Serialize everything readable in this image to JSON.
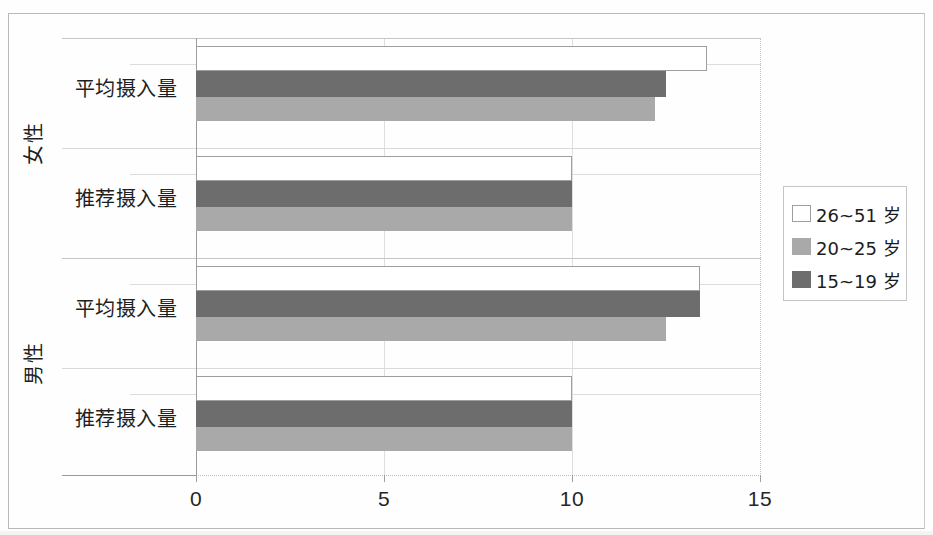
{
  "chart_data": {
    "type": "bar",
    "orientation": "horizontal",
    "title": "",
    "xlabel": "",
    "ylabel": "",
    "xlim": [
      0,
      15
    ],
    "xticks": [
      0,
      5,
      10,
      15
    ],
    "xtick_labels": [
      "0",
      "5",
      "10",
      "15"
    ],
    "grid": true,
    "legend_position": "right",
    "groups": [
      {
        "name": "女性",
        "categories": [
          "平均摄入量",
          "推荐摄入量"
        ]
      },
      {
        "name": "男性",
        "categories": [
          "平均摄入量",
          "推荐摄入量"
        ]
      }
    ],
    "categories": [
      "女性 - 平均摄入量",
      "女性 - 推荐摄入量",
      "男性 - 平均摄入量",
      "男性 - 推荐摄入量"
    ],
    "series": [
      {
        "name": "26~51 岁",
        "color": "#ffffff",
        "values": [
          13.6,
          10.0,
          13.4,
          10.0
        ]
      },
      {
        "name": "20~25 岁",
        "color": "#a9a9a9",
        "values": [
          12.2,
          10.0,
          12.5,
          10.0
        ]
      },
      {
        "name": "15~19 岁",
        "color": "#6d6d6d",
        "values": [
          12.5,
          10.0,
          13.4,
          10.0
        ]
      }
    ]
  },
  "legend": {
    "items": [
      {
        "label": "26~51 岁",
        "swatch": "white-swatch"
      },
      {
        "label": "20~25 岁",
        "swatch": "light-gray-swatch"
      },
      {
        "label": "15~19 岁",
        "swatch": "dark-gray-swatch"
      }
    ]
  },
  "axis": {
    "x_tick_labels": [
      "0",
      "5",
      "10",
      "15"
    ]
  },
  "labels": {
    "group_female": "女性",
    "group_male": "男性",
    "cat_average": "平均摄入量",
    "cat_recommended": "推荐摄入量"
  },
  "colors": {
    "series_26_51": "#ffffff",
    "series_20_25": "#a9a9a9",
    "series_15_19": "#6d6d6d",
    "axis": "#9a9a9a",
    "grid": "#dedede",
    "frame": "#b9b9b9"
  }
}
